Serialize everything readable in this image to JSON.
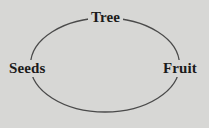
{
  "diagram": {
    "type": "cycle-diagram",
    "shape": "ellipse",
    "background_color": "#d7d7d5",
    "stroke_color": "#4a4a4a",
    "text_color": "#1b1b1b",
    "nodes": [
      {
        "id": "tree",
        "label": "Tree",
        "position": "top"
      },
      {
        "id": "seeds",
        "label": "Seeds",
        "position": "left"
      },
      {
        "id": "fruit",
        "label": "Fruit",
        "position": "right"
      }
    ]
  }
}
